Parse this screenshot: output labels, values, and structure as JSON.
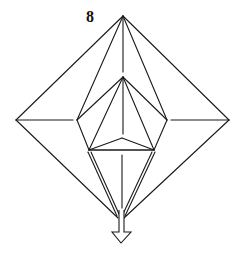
{
  "diagram": {
    "step_number": "8",
    "colors": {
      "line": "#1a1a1a",
      "background": "#ffffff"
    },
    "shapes": {
      "outer_diamond": {
        "top": [
          123,
          16
        ],
        "left": [
          16,
          120
        ],
        "right": [
          229,
          120
        ],
        "bottom": [
          120,
          218
        ]
      },
      "inner_kite": {
        "apex": [
          123,
          77
        ],
        "left": [
          77,
          120
        ],
        "right": [
          167,
          120
        ],
        "band_left": [
          89,
          150
        ],
        "band_right": [
          154,
          150
        ],
        "center": [
          122,
          138
        ]
      },
      "arrow": {
        "direction": "down",
        "tip": [
          121,
          243
        ]
      }
    },
    "annotation": "Arrow indicates pulling the lower point downward"
  }
}
